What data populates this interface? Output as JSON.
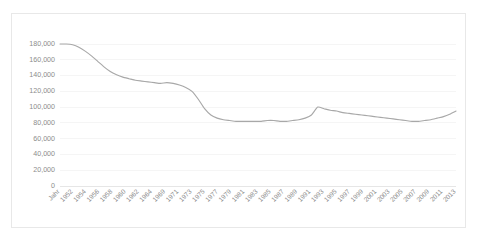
{
  "chart_data": {
    "type": "line",
    "title": "",
    "subtitle": "",
    "xlabel": "",
    "ylabel": "",
    "grid": true,
    "legend": false,
    "legend_position": "none",
    "line_color": "#a8a8a8",
    "background_color": "#ffffff",
    "border_color": "#e8e8e8",
    "gridline_color": "#f2f2f2",
    "tick_label_color": "#8c8c8c",
    "ylim": [
      0,
      180000
    ],
    "ytick_values": [
      0,
      20000,
      40000,
      60000,
      80000,
      100000,
      120000,
      140000,
      160000,
      180000
    ],
    "ytick_labels": [
      "0",
      "20,000",
      "40,000",
      "60,000",
      "80,000",
      "100,000",
      "120,000",
      "140,000",
      "160,000",
      "180,000"
    ],
    "xtick_labels": [
      "Jahr",
      "1952",
      "1954",
      "1956",
      "1958",
      "1960",
      "1962",
      "1964",
      "1969",
      "1971",
      "1973",
      "1975",
      "1977",
      "1979",
      "1981",
      "1983",
      "1985",
      "1987",
      "1989",
      "1991",
      "1993",
      "1995",
      "1997",
      "1999",
      "2001",
      "2003",
      "2005",
      "2007",
      "2009",
      "2011",
      "2013"
    ],
    "xtick_rotation": 45,
    "categories": [
      "1950",
      "1951",
      "1952",
      "1953",
      "1954",
      "1955",
      "1956",
      "1957",
      "1958",
      "1959",
      "1960",
      "1961",
      "1962",
      "1963",
      "1964",
      "1965",
      "1966",
      "1967",
      "1968",
      "1969",
      "1970",
      "1971",
      "1972",
      "1973",
      "1974",
      "1975",
      "1976",
      "1977",
      "1978",
      "1979",
      "1980",
      "1981",
      "1982",
      "1983",
      "1984",
      "1985",
      "1986",
      "1987",
      "1988",
      "1989",
      "1990",
      "1991",
      "1992",
      "1993",
      "1994",
      "1995",
      "1996",
      "1997",
      "1998",
      "1999",
      "2000",
      "2001",
      "2002",
      "2003",
      "2004",
      "2005",
      "2006",
      "2007",
      "2008",
      "2009",
      "2010",
      "2011",
      "2012",
      "2013"
    ],
    "values": [
      180000,
      180000,
      179000,
      176000,
      171000,
      165000,
      158000,
      151000,
      145000,
      141000,
      138000,
      136000,
      134000,
      133000,
      132000,
      131000,
      130000,
      131000,
      130000,
      128000,
      125000,
      120000,
      110000,
      98000,
      90000,
      86000,
      84000,
      83000,
      82000,
      82000,
      82000,
      82000,
      82000,
      83000,
      83000,
      82000,
      82000,
      83000,
      84000,
      86000,
      90000,
      100000,
      98000,
      96000,
      95000,
      93000,
      92000,
      91000,
      90000,
      89000,
      88000,
      87000,
      86000,
      85000,
      84000,
      83000,
      82000,
      82000,
      83000,
      84000,
      86000,
      88000,
      91000,
      95000
    ]
  }
}
